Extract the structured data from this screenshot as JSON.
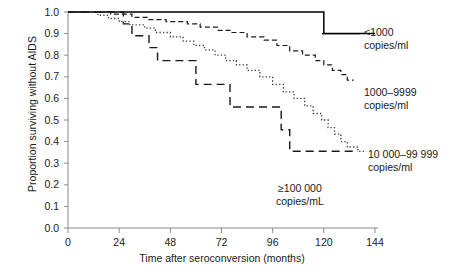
{
  "chart_data": {
    "type": "line",
    "title": "",
    "subtitle": "",
    "xlabel": "Time after seroconversion (months)",
    "ylabel": "Proportion surviving without AIDS",
    "xlim": [
      0,
      144
    ],
    "ylim": [
      0,
      1
    ],
    "grid": false,
    "legend_position": "inline-right-annotations",
    "x_ticks": [
      0,
      24,
      48,
      72,
      96,
      120,
      144
    ],
    "x_tick_labels": [
      "0",
      "24",
      "48",
      "72",
      "96",
      "120",
      "144"
    ],
    "y_ticks": [
      0.0,
      0.1,
      0.2,
      0.3,
      0.4,
      0.5,
      0.6,
      0.7,
      0.8,
      0.9,
      1.0
    ],
    "y_tick_labels": [
      "0.0",
      "0.1",
      "0.2",
      "0.3",
      "0.4",
      "0.5",
      "0.6",
      "0.7",
      "0.8",
      "0.9",
      "1.0"
    ],
    "series": [
      {
        "name": "<1000 copies/ml",
        "label_line1": "<1000",
        "label_line2": "copies/ml",
        "style": "solid",
        "color": "#000000",
        "x": [
          0,
          120,
          120,
          144
        ],
        "y": [
          1.0,
          1.0,
          0.9,
          0.9
        ],
        "points": [
          [
            0,
            1.0
          ],
          [
            120,
            1.0
          ],
          [
            120,
            0.9
          ],
          [
            144,
            0.9
          ]
        ]
      },
      {
        "name": "1000-9999 copies/ml",
        "label_line1": "1000–9999",
        "label_line2": "copies/ml",
        "style": "dashed",
        "color": "#1a1a1a",
        "points": [
          [
            0,
            1.0
          ],
          [
            20,
            1.0
          ],
          [
            20,
            0.99
          ],
          [
            30,
            0.99
          ],
          [
            30,
            0.975
          ],
          [
            38,
            0.975
          ],
          [
            38,
            0.965
          ],
          [
            46,
            0.965
          ],
          [
            46,
            0.955
          ],
          [
            56,
            0.955
          ],
          [
            56,
            0.945
          ],
          [
            62,
            0.945
          ],
          [
            62,
            0.93
          ],
          [
            70,
            0.93
          ],
          [
            70,
            0.915
          ],
          [
            76,
            0.915
          ],
          [
            76,
            0.905
          ],
          [
            84,
            0.905
          ],
          [
            84,
            0.885
          ],
          [
            92,
            0.885
          ],
          [
            92,
            0.87
          ],
          [
            98,
            0.87
          ],
          [
            98,
            0.845
          ],
          [
            104,
            0.845
          ],
          [
            104,
            0.82
          ],
          [
            110,
            0.82
          ],
          [
            110,
            0.8
          ],
          [
            116,
            0.8
          ],
          [
            116,
            0.775
          ],
          [
            120,
            0.775
          ],
          [
            120,
            0.755
          ],
          [
            124,
            0.755
          ],
          [
            124,
            0.73
          ],
          [
            128,
            0.73
          ],
          [
            128,
            0.71
          ],
          [
            131,
            0.71
          ],
          [
            131,
            0.685
          ],
          [
            134,
            0.685
          ]
        ]
      },
      {
        "name": "10 000-99 999 copies/ml",
        "label_line1": "10 000–99 999",
        "label_line2": "copies/ml",
        "style": "dotted",
        "color": "#3a3a3a",
        "points": [
          [
            0,
            1.0
          ],
          [
            14,
            1.0
          ],
          [
            14,
            0.985
          ],
          [
            19,
            0.985
          ],
          [
            19,
            0.97
          ],
          [
            24,
            0.97
          ],
          [
            24,
            0.955
          ],
          [
            29,
            0.955
          ],
          [
            29,
            0.94
          ],
          [
            36,
            0.94
          ],
          [
            36,
            0.925
          ],
          [
            41,
            0.925
          ],
          [
            41,
            0.905
          ],
          [
            48,
            0.905
          ],
          [
            48,
            0.885
          ],
          [
            54,
            0.885
          ],
          [
            54,
            0.865
          ],
          [
            59,
            0.865
          ],
          [
            59,
            0.845
          ],
          [
            64,
            0.845
          ],
          [
            64,
            0.825
          ],
          [
            69,
            0.825
          ],
          [
            69,
            0.8
          ],
          [
            74,
            0.8
          ],
          [
            74,
            0.775
          ],
          [
            79,
            0.775
          ],
          [
            79,
            0.755
          ],
          [
            84,
            0.755
          ],
          [
            84,
            0.73
          ],
          [
            90,
            0.73
          ],
          [
            90,
            0.7
          ],
          [
            96,
            0.7
          ],
          [
            96,
            0.665
          ],
          [
            101,
            0.665
          ],
          [
            101,
            0.63
          ],
          [
            106,
            0.63
          ],
          [
            106,
            0.6
          ],
          [
            111,
            0.6
          ],
          [
            111,
            0.565
          ],
          [
            115,
            0.565
          ],
          [
            115,
            0.53
          ],
          [
            119,
            0.53
          ],
          [
            119,
            0.5
          ],
          [
            122,
            0.5
          ],
          [
            122,
            0.465
          ],
          [
            125,
            0.465
          ],
          [
            125,
            0.435
          ],
          [
            128,
            0.435
          ],
          [
            128,
            0.4
          ],
          [
            131,
            0.4
          ],
          [
            131,
            0.375
          ],
          [
            136,
            0.375
          ],
          [
            136,
            0.355
          ],
          [
            140,
            0.355
          ]
        ]
      },
      {
        "name": "≥100 000 copies/mL",
        "label_line1": "≥100 000",
        "label_line2": "copies/mL",
        "style": "longdash",
        "color": "#1a1a1a",
        "points": [
          [
            0,
            1.0
          ],
          [
            26,
            1.0
          ],
          [
            26,
            0.945
          ],
          [
            30,
            0.945
          ],
          [
            30,
            0.89
          ],
          [
            38,
            0.89
          ],
          [
            38,
            0.835
          ],
          [
            42,
            0.835
          ],
          [
            42,
            0.775
          ],
          [
            60,
            0.775
          ],
          [
            60,
            0.665
          ],
          [
            76,
            0.665
          ],
          [
            76,
            0.56
          ],
          [
            100,
            0.56
          ],
          [
            100,
            0.455
          ],
          [
            104,
            0.455
          ],
          [
            104,
            0.355
          ],
          [
            136,
            0.355
          ]
        ]
      }
    ]
  },
  "annotations": {
    "series_1": {
      "line1": "<1000",
      "line2": "copies/ml"
    },
    "series_2": {
      "line1": "1000–9999",
      "line2": "copies/ml"
    },
    "series_3": {
      "line1": "10 000–99 999",
      "line2": "copies/ml"
    },
    "series_4": {
      "line1": "≥100 000",
      "line2": "copies/mL"
    }
  }
}
